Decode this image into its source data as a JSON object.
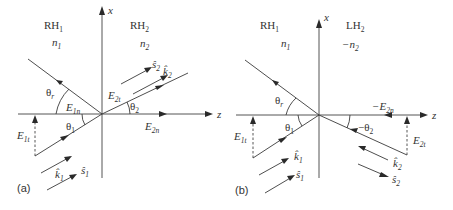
{
  "figure": {
    "panel_a": {
      "label": "(a)",
      "medium1": {
        "name": "RH",
        "sub": "1",
        "index": "n",
        "index_sub": "1"
      },
      "medium2": {
        "name": "RH",
        "sub": "2",
        "index": "n",
        "index_sub": "2",
        "index_prefix": ""
      },
      "axis_x": "x",
      "axis_z": "z",
      "theta_r": {
        "sym": "θ",
        "sub": "r"
      },
      "theta_1": {
        "sym": "θ",
        "sub": "1"
      },
      "theta_2": {
        "sym": "θ",
        "sub": "2",
        "prefix": ""
      },
      "E1n": {
        "sym": "E",
        "sub": "1n",
        "prefix": ""
      },
      "E1t": {
        "sym": "E",
        "sub": "1t"
      },
      "E2t": {
        "sym": "E",
        "sub": "2t"
      },
      "E2n": {
        "sym": "E",
        "sub": "2n",
        "prefix": ""
      },
      "k1": {
        "sym": "k̂",
        "sub": "1"
      },
      "s1": {
        "sym": "ŝ",
        "sub": "1"
      },
      "k2": {
        "sym": "k̂",
        "sub": "2"
      },
      "s2": {
        "sym": "ŝ",
        "sub": "2"
      }
    },
    "panel_b": {
      "label": "(b)",
      "medium1": {
        "name": "RH",
        "sub": "1",
        "index": "n",
        "index_sub": "1"
      },
      "medium2": {
        "name": "LH",
        "sub": "2",
        "index": "n",
        "index_sub": "2",
        "index_prefix": "−"
      },
      "axis_x": "x",
      "axis_z": "z",
      "theta_r": {
        "sym": "θ",
        "sub": "r"
      },
      "theta_1": {
        "sym": "θ",
        "sub": "1"
      },
      "theta_2": {
        "sym": "θ",
        "sub": "2",
        "prefix": "−"
      },
      "E1t": {
        "sym": "E",
        "sub": "1t"
      },
      "E2t": {
        "sym": "E",
        "sub": "2t"
      },
      "E2n": {
        "sym": "E",
        "sub": "2n",
        "prefix": "−"
      },
      "k1": {
        "sym": "k̂",
        "sub": "1"
      },
      "s1": {
        "sym": "ŝ",
        "sub": "1"
      },
      "k2": {
        "sym": "k̂",
        "sub": "2"
      },
      "s2": {
        "sym": "ŝ",
        "sub": "2"
      }
    }
  }
}
